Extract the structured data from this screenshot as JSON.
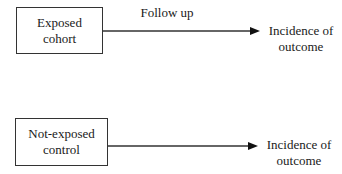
{
  "diagram": {
    "exposed_box": {
      "line1": "Exposed",
      "line2": "cohort"
    },
    "control_box": {
      "line1": "Not-exposed",
      "line2": "control"
    },
    "top_arrow_label": "Follow up",
    "top_outcome": {
      "line1": "Incidence of",
      "line2": "outcome"
    },
    "bottom_outcome": {
      "line1": "Incidence of",
      "line2": "outcome"
    },
    "colors": {
      "line": "#333333",
      "text": "#1a1a1a",
      "background": "#ffffff"
    }
  }
}
